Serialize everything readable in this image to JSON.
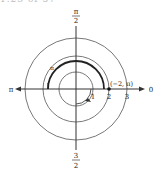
{
  "title_partial": "1.23 of 57",
  "diagram": {
    "type": "polar-plot",
    "axis_labels": {
      "top_num": "π",
      "top_den": "2",
      "bottom_num": "3",
      "bottom_den": "2",
      "left": "π",
      "right": "0"
    },
    "radial_ticks": [
      "1",
      "2",
      "3"
    ],
    "circles_radii": [
      1,
      2,
      3
    ],
    "point_label": "(−2, π)",
    "arc_marker": "π",
    "colors": {
      "stroke": "#333333",
      "thick_arc": "#222222",
      "background": "#ffffff"
    }
  }
}
